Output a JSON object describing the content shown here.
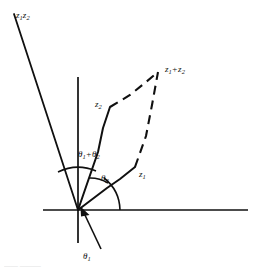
{
  "figure": {
    "kind": "complex-plane-vector-diagram",
    "labels": {
      "product": {
        "base": "z",
        "sub1": "1",
        "base2": "z",
        "sub2": "2"
      },
      "sum": {
        "base": "z",
        "sub1": "1",
        "operator": "+",
        "base2": "z",
        "sub2": "2"
      },
      "z1": {
        "base": "z",
        "sub": "1"
      },
      "z2": {
        "base": "z",
        "sub": "2"
      },
      "theta1": {
        "base": "θ",
        "sub": "1"
      },
      "theta2": {
        "base": "θ",
        "sub": "2"
      },
      "theta_sum": {
        "base": "θ",
        "sub1": "1",
        "operator": "+",
        "base2": "θ",
        "sub2": "2"
      }
    },
    "colors": {
      "ink": "#101010",
      "background": "#ffffff",
      "caption_ghost": "#555555"
    },
    "axes": {
      "origin": {
        "x": 78,
        "y": 210
      },
      "horizontal": {
        "x1": 43,
        "y1": 210,
        "x2": 248,
        "y2": 210
      },
      "vertical": {
        "x1": 78,
        "y1": 77,
        "x2": 78,
        "y2": 243
      }
    },
    "vectors": [
      {
        "name": "z1",
        "from": {
          "x": 78,
          "y": 210
        },
        "to": {
          "x": 135,
          "y": 167
        },
        "style": "solid"
      },
      {
        "name": "z2",
        "from": {
          "x": 78,
          "y": 210
        },
        "to": {
          "x": 110,
          "y": 107
        },
        "style": "solid"
      },
      {
        "name": "z1z2",
        "from": {
          "x": 78,
          "y": 210
        },
        "to": {
          "x": 14,
          "y": 14
        },
        "style": "solid"
      }
    ],
    "dashed_edges": [
      {
        "name": "z2-to-sum",
        "from": {
          "x": 110,
          "y": 107
        },
        "to": {
          "x": 158,
          "y": 72
        }
      },
      {
        "name": "z1-to-sum",
        "from": {
          "x": 135,
          "y": 167
        },
        "to": {
          "x": 158,
          "y": 72
        }
      }
    ],
    "arcs": [
      {
        "name": "theta1-arc",
        "radius": 26,
        "start_deg": 0,
        "end_deg": 37
      },
      {
        "name": "theta2-arc",
        "radius": 34,
        "start_deg": 37,
        "end_deg": 73
      },
      {
        "name": "theta-sum-arc",
        "radius": 46,
        "start_deg": 0,
        "end_deg": 72
      },
      {
        "name": "theta-sum-outer-arc",
        "radius": 52,
        "start_deg": 60,
        "end_deg": 108
      }
    ],
    "pointer": {
      "name": "theta1-pointer",
      "from": {
        "x": 100,
        "y": 248
      },
      "to": {
        "x": 82,
        "y": 212
      },
      "has_arrowhead": true
    },
    "caption_ghost_text": "——  ———"
  }
}
